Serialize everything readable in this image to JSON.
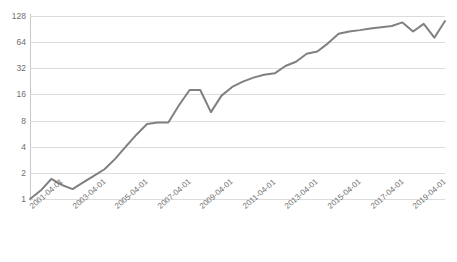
{
  "chart": {
    "title": "",
    "title_remnant": "",
    "line_color": "#808080",
    "grid_color": "#dcdcdc",
    "axis_color": "#c9c9c9",
    "label_color": "#6e6e6e"
  },
  "chart_data": {
    "type": "line",
    "title": "",
    "xlabel": "",
    "ylabel": "",
    "yscale": "log2",
    "ylim": [
      1,
      128
    ],
    "ytick_labels": [
      "128",
      "64",
      "32",
      "16",
      "8",
      "4",
      "2",
      "1"
    ],
    "ytick_values": [
      128,
      64,
      32,
      16,
      8,
      4,
      2,
      1
    ],
    "grid": true,
    "legend": "none",
    "xtick_labels": [
      "2001-04-01",
      "2003-04-01",
      "2005-04-01",
      "2007-04-01",
      "2009-04-01",
      "2011-04-01",
      "2013-04-01",
      "2015-04-01",
      "2017-04-01",
      "2019-04-01"
    ],
    "xtick_rotation_deg": -41,
    "x": [
      "2001-04-01",
      "2001-10-01",
      "2002-04-01",
      "2002-10-01",
      "2003-04-01",
      "2003-10-01",
      "2004-04-01",
      "2004-10-01",
      "2005-04-01",
      "2005-10-01",
      "2006-04-01",
      "2006-10-01",
      "2007-04-01",
      "2007-10-01",
      "2008-04-01",
      "2008-10-01",
      "2009-04-01",
      "2009-10-01",
      "2010-04-01",
      "2010-10-01",
      "2011-04-01",
      "2011-10-01",
      "2012-04-01",
      "2012-10-01",
      "2013-04-01",
      "2013-10-01",
      "2014-04-01",
      "2014-10-01",
      "2015-04-01",
      "2015-10-01",
      "2016-04-01",
      "2016-10-01",
      "2017-04-01",
      "2017-10-01",
      "2018-04-01",
      "2018-10-01",
      "2019-04-01",
      "2019-10-01",
      "2020-04-01",
      "2020-10-01"
    ],
    "series": [
      {
        "name": "value",
        "values": [
          1.0,
          1.25,
          1.7,
          1.45,
          1.3,
          1.55,
          1.85,
          2.2,
          2.9,
          4.0,
          5.5,
          7.3,
          7.6,
          7.6,
          12.0,
          18.0,
          18.0,
          10.0,
          15.5,
          19.5,
          22.5,
          25.0,
          27.0,
          28.0,
          34.0,
          38.0,
          47.0,
          50.0,
          62.0,
          80.0,
          85.0,
          88.0,
          92.0,
          95.0,
          98.0,
          108.0,
          85.0,
          104.0,
          72.0,
          112.0
        ]
      }
    ]
  }
}
